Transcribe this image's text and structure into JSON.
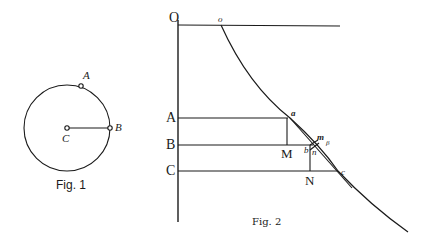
{
  "figure1": {
    "caption": "Fig. 1",
    "labels": {
      "A": "A",
      "B": "B",
      "C": "C"
    },
    "circle": {
      "cx": 67,
      "cy": 128,
      "r": 43
    },
    "points": {
      "A": [
        81,
        86
      ],
      "B": [
        110,
        128
      ],
      "C": [
        67,
        128
      ]
    }
  },
  "figure2": {
    "caption": "Fig. 2",
    "labels": {
      "O": "O",
      "o": "o",
      "A": "A",
      "B": "B",
      "C": "C",
      "M": "M",
      "N": "N",
      "a": "a",
      "b": "b",
      "c": "c",
      "m": "m",
      "n": "n",
      "p": "β"
    }
  },
  "colors": {
    "ink": "#1a1a1a",
    "background": "#ffffff"
  }
}
